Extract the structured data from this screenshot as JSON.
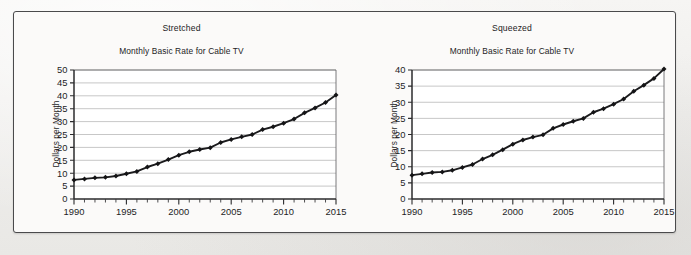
{
  "figure": {
    "panels": [
      {
        "key": "stretched",
        "name": "Stretched",
        "title": "Stretched",
        "subtitle": "Monthly Basic Rate for Cable TV",
        "ylabel": "Dollars per Month"
      },
      {
        "key": "squeezed",
        "name": "Squeezed",
        "title": "Squeezed",
        "subtitle": "Monthly Basic Rate for Cable TV",
        "ylabel": "Dollars per Month"
      }
    ],
    "colors": {
      "page_background": "#f2f1ef",
      "panel_background": "#fbfaf9",
      "frame_border": "#4a4a4c",
      "gridline": "#b9b9b9",
      "axis": "#2b2b2d",
      "data_line": "#1b1b1d",
      "marker": "#141416",
      "text": "#1d1d1f"
    }
  },
  "chart_data": [
    {
      "type": "line",
      "id": "stretched",
      "title": "Monthly Basic Rate for Cable TV",
      "annotation": "Stretched",
      "xlabel": "",
      "ylabel": "Dollars per Month",
      "xlim": [
        1990,
        2015
      ],
      "ylim": [
        0,
        50
      ],
      "ytick_values": [
        0,
        5,
        10,
        15,
        20,
        25,
        30,
        35,
        40,
        45,
        50
      ],
      "ytick_labels": [
        "0",
        "5",
        "10",
        "15",
        "20",
        "25",
        "30",
        "35",
        "40",
        "45",
        "50"
      ],
      "xtick_values": [
        1990,
        1995,
        2000,
        2005,
        2010,
        2015
      ],
      "xtick_labels": [
        "1990",
        "1995",
        "2000",
        "2005",
        "2010",
        "2015"
      ],
      "x_minor_tick_step": 1,
      "grid": "horizontal",
      "legend": "none",
      "marker": "diamond",
      "x": [
        1990,
        1991,
        1992,
        1993,
        1994,
        1995,
        1996,
        1997,
        1998,
        1999,
        2000,
        2001,
        2002,
        2003,
        2004,
        2005,
        2006,
        2007,
        2008,
        2009,
        2010,
        2011,
        2012,
        2013,
        2014,
        2015
      ],
      "values": [
        7.4,
        7.8,
        8.2,
        8.4,
        8.9,
        9.8,
        10.7,
        12.4,
        13.7,
        15.3,
        17.0,
        18.3,
        19.2,
        19.9,
        21.9,
        23.1,
        24.1,
        25.0,
        26.9,
        28.0,
        29.4,
        31.0,
        33.4,
        35.3,
        37.4,
        40.3
      ]
    },
    {
      "type": "line",
      "id": "squeezed",
      "title": "Monthly Basic Rate for Cable TV",
      "annotation": "Squeezed",
      "xlabel": "",
      "ylabel": "Dollars per Month",
      "xlim": [
        1990,
        2015
      ],
      "ylim": [
        0,
        40
      ],
      "ytick_values": [
        0,
        5,
        10,
        15,
        20,
        25,
        30,
        35,
        40
      ],
      "ytick_labels": [
        "0",
        "5",
        "10",
        "15",
        "20",
        "25",
        "30",
        "35",
        "40"
      ],
      "xtick_values": [
        1990,
        1995,
        2000,
        2005,
        2010,
        2015
      ],
      "xtick_labels": [
        "1990",
        "1995",
        "2000",
        "2005",
        "2010",
        "2015"
      ],
      "x_minor_tick_step": 1,
      "grid": "horizontal",
      "legend": "none",
      "marker": "diamond",
      "x": [
        1990,
        1991,
        1992,
        1993,
        1994,
        1995,
        1996,
        1997,
        1998,
        1999,
        2000,
        2001,
        2002,
        2003,
        2004,
        2005,
        2006,
        2007,
        2008,
        2009,
        2010,
        2011,
        2012,
        2013,
        2014,
        2015
      ],
      "values": [
        7.4,
        7.8,
        8.2,
        8.4,
        8.9,
        9.8,
        10.7,
        12.4,
        13.7,
        15.3,
        17.0,
        18.3,
        19.2,
        19.9,
        21.9,
        23.1,
        24.1,
        25.0,
        26.9,
        28.0,
        29.4,
        31.0,
        33.4,
        35.3,
        37.4,
        40.3
      ]
    }
  ]
}
